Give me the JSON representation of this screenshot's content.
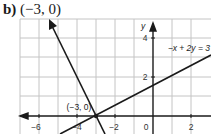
{
  "problem": {
    "part_label": "b)",
    "answer": "(−3, 0)"
  },
  "graph": {
    "axis_labels": {
      "y": "y"
    },
    "x_tick_labels": [
      "−6",
      "−4",
      "−2",
      "0",
      "2"
    ],
    "y_tick_labels": [
      "4",
      "2"
    ],
    "point_label": "(−3, 0)",
    "line_equation_label": "−x + 2y = 3",
    "colors": {
      "grid": "#bfbfbf",
      "axes": "#1a1a1a",
      "lines": "#1a1a1a"
    }
  }
}
